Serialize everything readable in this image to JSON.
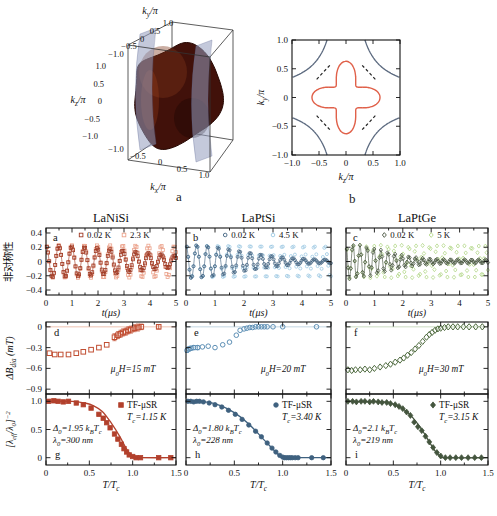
{
  "captions": {
    "panel_a": "a",
    "panel_b": "b"
  },
  "materials": [
    "LaNiSi",
    "LaPtSi",
    "LaPtGe"
  ],
  "chart_data": {
    "fermi_surface_3d": {
      "type": "isosurface3d",
      "caption": "a",
      "xlabel": "k~x~/π",
      "ylabel": "k~y~/π",
      "zlabel": "k~z~/π",
      "xticks": [
        "−1.0",
        "−0.5",
        "0",
        "0.5",
        "1.0"
      ],
      "yticks": [
        "1.0",
        "0.5",
        "0",
        "−0.5",
        "−1.0"
      ],
      "zticks": [
        "1.0",
        "0.5",
        "0",
        "−0.5",
        "−1.0"
      ],
      "xlim": [
        -1,
        1
      ],
      "ylim": [
        -1,
        1
      ],
      "zlim": [
        -1,
        1
      ],
      "surface_color": "#41110a",
      "sheet_color": "rgba(148,156,190,0.55)",
      "description": "dark red Fermi-surface pocket centered in the Brillouin zone with translucent blue-gray vertical sheets"
    },
    "fermi_surface_2d": {
      "type": "contour",
      "caption": "b",
      "xlabel": "k~z~/π",
      "ylabel": "k~y~/π",
      "xlim": [
        -1,
        1
      ],
      "ylim": [
        -1,
        1
      ],
      "xticks": [
        "−1.0",
        "−0.5",
        "0",
        "0.5",
        "1.0"
      ],
      "yticks": [
        "1.0",
        "0.5",
        "0",
        "−0.5",
        "−1.0"
      ],
      "star_contour": {
        "color": "#e0614a",
        "tip_radius": 0.63,
        "waist_radius": 0.27
      },
      "corner_contours": {
        "color": "#5d6b80",
        "xy_product": 0.35
      },
      "nodal_dashes": {
        "color": "#222222",
        "inner": 0.3,
        "outer": 0.56
      }
    },
    "columns": [
      {
        "material": "LaNiSi",
        "asymmetry": {
          "type": "scatter",
          "letter": "a",
          "xlabel": "t(μs)",
          "ylabel": "非对称性",
          "xlim": [
            0,
            5
          ],
          "ylim": [
            -0.4,
            0.4
          ],
          "xticks": [
            "0",
            "1",
            "2",
            "3",
            "4",
            "5"
          ],
          "yticks": [
            "0.4",
            "0.2",
            "0",
            "−0.2",
            "−0.4"
          ],
          "series": [
            {
              "label": "0.02 K",
              "marker": "square",
              "color": "#a03b25",
              "model": "damped_cosine",
              "amplitude": 0.22,
              "frequency_per_us": 2.03,
              "gaussian_sigma": 0.28,
              "floor": 0.0,
              "fit_line": true
            },
            {
              "label": "2.3 K",
              "marker": "square",
              "color": "#eba28b",
              "model": "damped_cosine",
              "amplitude": 0.23,
              "frequency_per_us": 2.03,
              "gaussian_sigma": 0.07,
              "floor": 0.0,
              "fit_line": false
            }
          ]
        },
        "field_shift": {
          "type": "scatter",
          "letter": "d",
          "ylabel": "ΔB~dia~ (mT)",
          "field_label": "μ~0~H=15 mT",
          "xlim": [
            0,
            1.5
          ],
          "ylim": [
            -0.9,
            0
          ],
          "yticks": [
            "0",
            "−0.3",
            "−0.6",
            "−0.9"
          ],
          "marker": "square",
          "color": "#c14f33",
          "zero_line_color": "#eec2b2",
          "x": [
            0.04,
            0.1,
            0.17,
            0.26,
            0.35,
            0.43,
            0.52,
            0.61,
            0.7,
            0.79,
            0.83,
            0.86,
            0.89,
            0.92,
            0.95,
            0.98,
            1.02,
            1.06,
            1.1,
            1.3
          ],
          "y": [
            -0.38,
            -0.4,
            -0.4,
            -0.4,
            -0.38,
            -0.36,
            -0.33,
            -0.3,
            -0.26,
            -0.15,
            -0.12,
            -0.1,
            -0.08,
            -0.07,
            -0.05,
            -0.04,
            -0.02,
            -0.01,
            0.0,
            0.0
          ],
          "yerr": [
            0,
            0,
            0,
            0,
            0,
            0,
            0,
            0,
            0,
            0.05,
            0.05,
            0.05,
            0.05,
            0.05,
            0.05,
            0.05,
            0.05,
            0.05,
            0.04,
            0.03
          ]
        },
        "superfluid_density": {
          "type": "scatter+fit",
          "letter": "g",
          "ylabel": "[λ~eff~/λ~0~]^−2^",
          "xlabel": "T/T~c~",
          "xticks": [
            "0",
            "0.5",
            "1.0",
            "1.5"
          ],
          "yticks": [
            "1.0",
            "0.5",
            "0"
          ],
          "xlim": [
            0,
            1.5
          ],
          "ylim": [
            0,
            1
          ],
          "legend": "TF-μSR",
          "tc_label": "T~c~=1.15 K",
          "gap_label": "Δ~0~=1.95 k~B~T~c~",
          "lambda_label": "λ~0~=300 nm",
          "marker": "square",
          "color": "#b2402c",
          "x": [
            0.03,
            0.09,
            0.14,
            0.2,
            0.26,
            0.35,
            0.43,
            0.52,
            0.61,
            0.66,
            0.7,
            0.74,
            0.79,
            0.83,
            0.87,
            0.9,
            0.93,
            0.96,
            1.0,
            1.04,
            1.09,
            1.3,
            1.44
          ],
          "y": [
            1.0,
            1.01,
            1.0,
            0.99,
            1.0,
            0.97,
            0.94,
            0.88,
            0.77,
            0.7,
            0.62,
            0.53,
            0.42,
            0.33,
            0.24,
            0.16,
            0.1,
            0.05,
            0.02,
            0.0,
            0.0,
            0.0,
            0.0
          ],
          "fit_x": [
            0,
            0.3,
            0.45,
            0.55,
            0.65,
            0.75,
            0.85,
            0.92,
            0.97,
            1.0,
            1.05,
            1.5
          ],
          "fit_y": [
            1.0,
            1.0,
            0.97,
            0.92,
            0.82,
            0.62,
            0.38,
            0.18,
            0.06,
            0.01,
            0.0,
            0.0
          ]
        }
      },
      {
        "material": "LaPtSi",
        "asymmetry": {
          "type": "scatter",
          "letter": "b",
          "xlabel": "t(μs)",
          "ylabel": "非对称性",
          "xlim": [
            0,
            5
          ],
          "ylim": [
            -0.4,
            0.4
          ],
          "xticks": [
            "0",
            "1",
            "2",
            "3",
            "4",
            "5"
          ],
          "yticks": [
            "0.4",
            "0.2",
            "0",
            "−0.2",
            "−0.4"
          ],
          "series": [
            {
              "label": "0.02 K",
              "marker": "circle",
              "color": "#3f617f",
              "model": "damped_cosine",
              "amplitude": 0.22,
              "frequency_per_us": 2.71,
              "gaussian_sigma": 0.55,
              "floor": 0.02,
              "fit_line": true
            },
            {
              "label": "4.5 K",
              "marker": "circle",
              "color": "#9cc8e2",
              "model": "damped_cosine",
              "amplitude": 0.23,
              "frequency_per_us": 2.71,
              "gaussian_sigma": 0.07,
              "floor": 0.0,
              "fit_line": false
            }
          ]
        },
        "field_shift": {
          "type": "scatter",
          "letter": "e",
          "ylabel": "ΔB~dia~ (mT)",
          "field_label": "μ~0~H=20 mT",
          "xlim": [
            0,
            1.5
          ],
          "ylim": [
            -0.9,
            0
          ],
          "yticks": [
            "0",
            "−0.3",
            "−0.6",
            "−0.9"
          ],
          "marker": "circle",
          "color": "#5d8fb5",
          "zero_line_color": "#c3d6e2",
          "x": [
            0.01,
            0.03,
            0.05,
            0.08,
            0.12,
            0.17,
            0.23,
            0.3,
            0.38,
            0.45,
            0.52,
            0.56,
            0.6,
            0.63,
            0.66,
            0.69,
            0.72,
            0.75,
            0.78,
            0.81,
            0.84,
            0.9,
            1.0,
            1.35
          ],
          "y": [
            -0.34,
            -0.32,
            -0.31,
            -0.3,
            -0.3,
            -0.29,
            -0.28,
            -0.3,
            -0.26,
            -0.22,
            -0.12,
            -0.05,
            -0.03,
            -0.02,
            -0.01,
            -0.01,
            0.0,
            0.0,
            0.0,
            0.0,
            0.0,
            0.0,
            0.0,
            0.0
          ],
          "yerr": [
            0.03,
            0.03,
            0.03,
            0.03,
            0.03,
            0,
            0,
            0,
            0,
            0,
            0,
            0,
            0,
            0,
            0,
            0,
            0,
            0,
            0,
            0,
            0,
            0,
            0,
            0
          ]
        },
        "superfluid_density": {
          "type": "scatter+fit",
          "letter": "h",
          "ylabel": "[λ~eff~/λ~0~]^−2^",
          "xlabel": "T/T~c~",
          "xticks": [
            "0",
            "0.5",
            "1.0",
            "1.5"
          ],
          "yticks": [
            "1.0",
            "0.5",
            "0"
          ],
          "xlim": [
            0,
            1.5
          ],
          "ylim": [
            0,
            1
          ],
          "legend": "TF-μSR",
          "tc_label": "T~c~=3.40 K",
          "gap_label": "Δ~0~=1.80 k~B~T~c~",
          "lambda_label": "λ~0~=228 nm",
          "marker": "circle",
          "color": "#3f617f",
          "x": [
            0.02,
            0.05,
            0.08,
            0.11,
            0.14,
            0.18,
            0.24,
            0.3,
            0.37,
            0.44,
            0.51,
            0.58,
            0.65,
            0.72,
            0.78,
            0.84,
            0.89,
            0.93,
            0.97,
            1.0,
            1.02,
            1.04,
            1.06,
            1.08,
            1.1,
            1.13,
            1.16,
            1.3,
            1.42
          ],
          "y": [
            1.0,
            1.0,
            0.99,
            1.0,
            1.0,
            0.99,
            0.97,
            0.94,
            0.9,
            0.84,
            0.77,
            0.68,
            0.58,
            0.47,
            0.37,
            0.26,
            0.17,
            0.1,
            0.04,
            0.01,
            0.0,
            0.0,
            0.0,
            0.0,
            0.0,
            0.0,
            0.0,
            0.0,
            0.0
          ],
          "fit_x": [
            0,
            0.2,
            0.35,
            0.5,
            0.65,
            0.8,
            0.9,
            0.97,
            1.0,
            1.05,
            1.5
          ],
          "fit_y": [
            1.0,
            0.99,
            0.93,
            0.8,
            0.6,
            0.33,
            0.15,
            0.03,
            0.005,
            0.0,
            0.0
          ]
        }
      },
      {
        "material": "LaPtGe",
        "asymmetry": {
          "type": "scatter",
          "letter": "c",
          "xlabel": "t(μs)",
          "ylabel": "非对称性",
          "xlim": [
            0,
            5
          ],
          "ylim": [
            -0.4,
            0.4
          ],
          "xticks": [
            "0",
            "1",
            "2",
            "3",
            "4",
            "5"
          ],
          "yticks": [
            "0.4",
            "0.2",
            "0",
            "−0.2",
            "−0.4"
          ],
          "series": [
            {
              "label": "0.02 K",
              "marker": "diamond",
              "color": "#48553f",
              "model": "damped_cosine",
              "amplitude": 0.22,
              "frequency_per_us": 4.07,
              "gaussian_sigma": 0.8,
              "floor": 0.025,
              "fit_line": true
            },
            {
              "label": "5 K",
              "marker": "diamond",
              "color": "#b3d788",
              "model": "damped_cosine",
              "amplitude": 0.23,
              "frequency_per_us": 4.07,
              "gaussian_sigma": 0.06,
              "floor": 0.0,
              "fit_line": false
            }
          ]
        },
        "field_shift": {
          "type": "scatter",
          "letter": "f",
          "ylabel": "ΔB~dia~ (mT)",
          "field_label": "μ~0~H=30 mT",
          "xlim": [
            0,
            1.5
          ],
          "ylim": [
            -0.9,
            0
          ],
          "yticks": [
            "0",
            "−0.3",
            "−0.6",
            "−0.9"
          ],
          "marker": "diamond",
          "color": "#4f6b3f",
          "zero_line_color": "#cbdcc2",
          "x": [
            0.02,
            0.06,
            0.1,
            0.15,
            0.2,
            0.25,
            0.3,
            0.36,
            0.42,
            0.47,
            0.52,
            0.57,
            0.61,
            0.65,
            0.69,
            0.73,
            0.77,
            0.81,
            0.85,
            0.88,
            0.91,
            0.94,
            0.97,
            1.0,
            1.04,
            1.08,
            1.13,
            1.18,
            1.24,
            1.3,
            1.37,
            1.44
          ],
          "y": [
            -0.62,
            -0.63,
            -0.62,
            -0.62,
            -0.61,
            -0.62,
            -0.6,
            -0.58,
            -0.56,
            -0.54,
            -0.51,
            -0.48,
            -0.45,
            -0.41,
            -0.37,
            -0.32,
            -0.27,
            -0.21,
            -0.15,
            -0.11,
            -0.08,
            -0.05,
            -0.03,
            -0.02,
            -0.01,
            0.0,
            0.0,
            0.0,
            0.0,
            0.0,
            0.0,
            0.0
          ],
          "yerr": [
            0,
            0,
            0,
            0,
            0,
            0,
            0,
            0,
            0,
            0,
            0,
            0,
            0,
            0,
            0,
            0,
            0,
            0,
            0,
            0,
            0,
            0,
            0,
            0,
            0,
            0,
            0,
            0,
            0,
            0,
            0,
            0
          ]
        },
        "superfluid_density": {
          "type": "scatter+fit",
          "letter": "i",
          "ylabel": "[λ~eff~/λ~0~]^−2^",
          "xlabel": "T/T~c~",
          "xticks": [
            "0",
            "0.5",
            "1.0",
            "1.5"
          ],
          "yticks": [
            "1.0",
            "0.5",
            "0"
          ],
          "xlim": [
            0,
            1.5
          ],
          "ylim": [
            0,
            1
          ],
          "legend": "TF-μSR",
          "tc_label": "T~c~=3.15 K",
          "gap_label": "Δ~0~=2.1 k~B~T~c~",
          "lambda_label": "λ~0~=219 nm",
          "marker": "diamond",
          "color": "#44553e",
          "x": [
            0.02,
            0.07,
            0.11,
            0.16,
            0.2,
            0.25,
            0.29,
            0.34,
            0.38,
            0.43,
            0.47,
            0.52,
            0.56,
            0.6,
            0.64,
            0.68,
            0.72,
            0.76,
            0.8,
            0.84,
            0.88,
            0.92,
            0.96,
            1.0,
            1.05,
            1.1,
            1.16,
            1.22,
            1.29,
            1.36,
            1.43
          ],
          "y": [
            1.0,
            1.0,
            0.99,
            1.0,
            1.0,
            0.99,
            1.0,
            0.99,
            0.98,
            0.98,
            0.96,
            0.94,
            0.91,
            0.87,
            0.81,
            0.75,
            0.63,
            0.55,
            0.48,
            0.38,
            0.28,
            0.18,
            0.09,
            0.03,
            0.0,
            0.0,
            0.0,
            0.0,
            0.0,
            0.0,
            0.0
          ],
          "fit_x": [
            0,
            0.4,
            0.5,
            0.6,
            0.7,
            0.8,
            0.88,
            0.95,
            1.0,
            1.05,
            1.5
          ],
          "fit_y": [
            1.0,
            0.99,
            0.95,
            0.87,
            0.72,
            0.5,
            0.28,
            0.1,
            0.02,
            0.0,
            0.0
          ]
        }
      }
    ]
  }
}
